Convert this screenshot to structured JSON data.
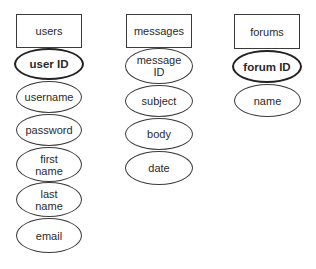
{
  "diagram": {
    "type": "entity-attribute",
    "entities": [
      {
        "name": "users",
        "attributes": [
          {
            "label": "user ID",
            "primary_key": true
          },
          {
            "label": "username",
            "primary_key": false
          },
          {
            "label": "password",
            "primary_key": false
          },
          {
            "label": "first\nname",
            "primary_key": false
          },
          {
            "label": "last\nname",
            "primary_key": false
          },
          {
            "label": "email",
            "primary_key": false
          }
        ]
      },
      {
        "name": "messages",
        "attributes": [
          {
            "label": "message\nID",
            "primary_key": false
          },
          {
            "label": "subject",
            "primary_key": false
          },
          {
            "label": "body",
            "primary_key": false
          },
          {
            "label": "date",
            "primary_key": false
          }
        ]
      },
      {
        "name": "forums",
        "attributes": [
          {
            "label": "forum ID",
            "primary_key": true
          },
          {
            "label": "name",
            "primary_key": false
          }
        ]
      }
    ]
  }
}
